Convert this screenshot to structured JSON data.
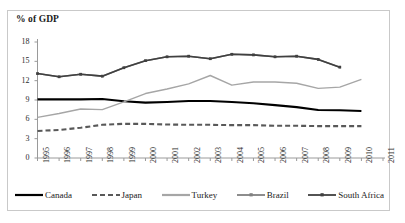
{
  "chart_data": {
    "type": "line",
    "title": "% of GDP",
    "xlabel": "",
    "ylabel": "% of GDP",
    "ylim": [
      0,
      18
    ],
    "ytick_step": 3,
    "yticks": [
      0,
      3,
      6,
      9,
      12,
      15,
      18
    ],
    "grid": false,
    "legend_position": "bottom",
    "x": [
      1995,
      1996,
      1997,
      1998,
      1999,
      2000,
      2001,
      2002,
      2003,
      2004,
      2005,
      2006,
      2007,
      2008,
      2009,
      2010,
      2011
    ],
    "categories": [
      "1995",
      "1996",
      "1997",
      "1998",
      "1999",
      "2000",
      "2001",
      "2002",
      "2003",
      "2004",
      "2005",
      "2006",
      "2007",
      "2008",
      "2009",
      "2010",
      "2011"
    ],
    "series": [
      {
        "name": "Canada",
        "color": "#000000",
        "style": "solid",
        "width": 2.1,
        "marker": "none",
        "values": [
          9.1,
          9.1,
          9.1,
          9.15,
          8.8,
          8.6,
          8.7,
          8.85,
          8.85,
          8.7,
          8.5,
          8.2,
          7.9,
          7.45,
          7.4,
          7.3,
          null
        ]
      },
      {
        "name": "Japan",
        "color": "#595959",
        "style": "dashed",
        "width": 2.1,
        "marker": "none",
        "values": [
          4.2,
          4.35,
          4.7,
          5.15,
          5.3,
          5.3,
          5.2,
          5.15,
          5.15,
          5.1,
          5.1,
          5.0,
          5.0,
          4.95,
          4.95,
          4.95,
          null
        ]
      },
      {
        "name": "Turkey",
        "color": "#a6a6a6",
        "style": "solid",
        "width": 1.4,
        "marker": "none",
        "values": [
          6.3,
          6.9,
          7.6,
          7.5,
          8.7,
          10.0,
          10.7,
          11.5,
          12.8,
          11.3,
          11.8,
          11.8,
          11.6,
          10.8,
          11.0,
          12.2,
          null
        ]
      },
      {
        "name": "Brazil",
        "color": "#808080",
        "style": "solid",
        "width": 1.6,
        "marker": "square",
        "values": [
          13.1,
          12.6,
          13.0,
          12.7,
          14.0,
          15.1,
          15.7,
          15.8,
          15.4,
          16.1,
          16.0,
          15.7,
          15.8,
          15.3,
          14.1,
          null,
          null
        ]
      },
      {
        "name": "South Africa",
        "color": "#404040",
        "style": "solid",
        "width": 1.6,
        "marker": "square",
        "values": [
          13.1,
          12.6,
          13.0,
          12.7,
          14.0,
          15.1,
          15.7,
          15.8,
          15.4,
          16.1,
          16.0,
          15.7,
          15.8,
          15.3,
          14.1,
          null,
          null
        ]
      }
    ],
    "legend": [
      {
        "label": "Canada",
        "color": "#000000",
        "style": "solid",
        "marker": "none"
      },
      {
        "label": "Japan",
        "color": "#595959",
        "style": "dashed",
        "marker": "none"
      },
      {
        "label": "Turkey",
        "color": "#a6a6a6",
        "style": "solid",
        "marker": "none"
      },
      {
        "label": "Brazil",
        "color": "#808080",
        "style": "solid",
        "marker": "square"
      },
      {
        "label": "South Africa",
        "color": "#404040",
        "style": "solid",
        "marker": "square"
      }
    ]
  }
}
